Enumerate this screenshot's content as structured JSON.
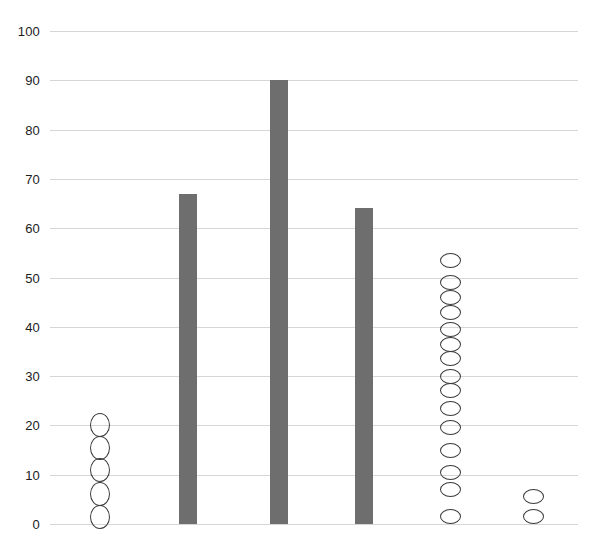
{
  "chart_data": {
    "type": "bar",
    "title": "",
    "subtitle": "",
    "xlabel": "",
    "ylabel": "",
    "ylim": [
      0,
      100
    ],
    "xlim": [
      0,
      6
    ],
    "grid": true,
    "grid_axis": "y",
    "legend": "none",
    "y_ticks": [
      0,
      10,
      20,
      30,
      40,
      50,
      60,
      70,
      80,
      90,
      100
    ],
    "y_tick_labels": [
      "0",
      "10",
      "20",
      "30",
      "40",
      "50",
      "60",
      "70",
      "80",
      "90",
      "100"
    ],
    "x_ticks": [],
    "x_tick_labels": [],
    "bar_color": "#6e6e6e",
    "marker_edge_color": "#3a3a3a",
    "marker_face_color": "none",
    "grid_color": "#d6d6d6",
    "categories": [
      "1",
      "2",
      "3",
      "4",
      "5",
      "6"
    ],
    "series": [
      {
        "name": "bars",
        "type": "bar",
        "values": [
          null,
          67,
          90,
          64,
          null,
          null
        ]
      },
      {
        "name": "points",
        "type": "scatter",
        "points": [
          {
            "category": "1",
            "values": [
              20,
              15.5,
              11,
              6,
              1.5
            ]
          },
          {
            "category": "5",
            "values": [
              53.5,
              49,
              46,
              43,
              39.5,
              36.5,
              33.5,
              30,
              27,
              23.5,
              19.5,
              15,
              10.5,
              7,
              1.5
            ]
          },
          {
            "category": "6",
            "values": [
              5.5,
              1.5
            ]
          }
        ]
      }
    ]
  },
  "geometry": {
    "plot_left": 50,
    "plot_right": 578,
    "y_zero_px": 524,
    "y_top_px": 31,
    "px_per_unit": 4.93,
    "columns": [
      {
        "center": 100,
        "bar_width": 18,
        "marker_w": 20,
        "marker_h": 24
      },
      {
        "center": 188,
        "bar_width": 18,
        "marker_w": 20,
        "marker_h": 24
      },
      {
        "center": 279,
        "bar_width": 18,
        "marker_w": 20,
        "marker_h": 24
      },
      {
        "center": 364,
        "bar_width": 18,
        "marker_w": 20,
        "marker_h": 24
      },
      {
        "center": 450,
        "bar_width": 18,
        "marker_w": 21,
        "marker_h": 15
      },
      {
        "center": 533,
        "bar_width": 18,
        "marker_w": 21,
        "marker_h": 15
      }
    ]
  }
}
